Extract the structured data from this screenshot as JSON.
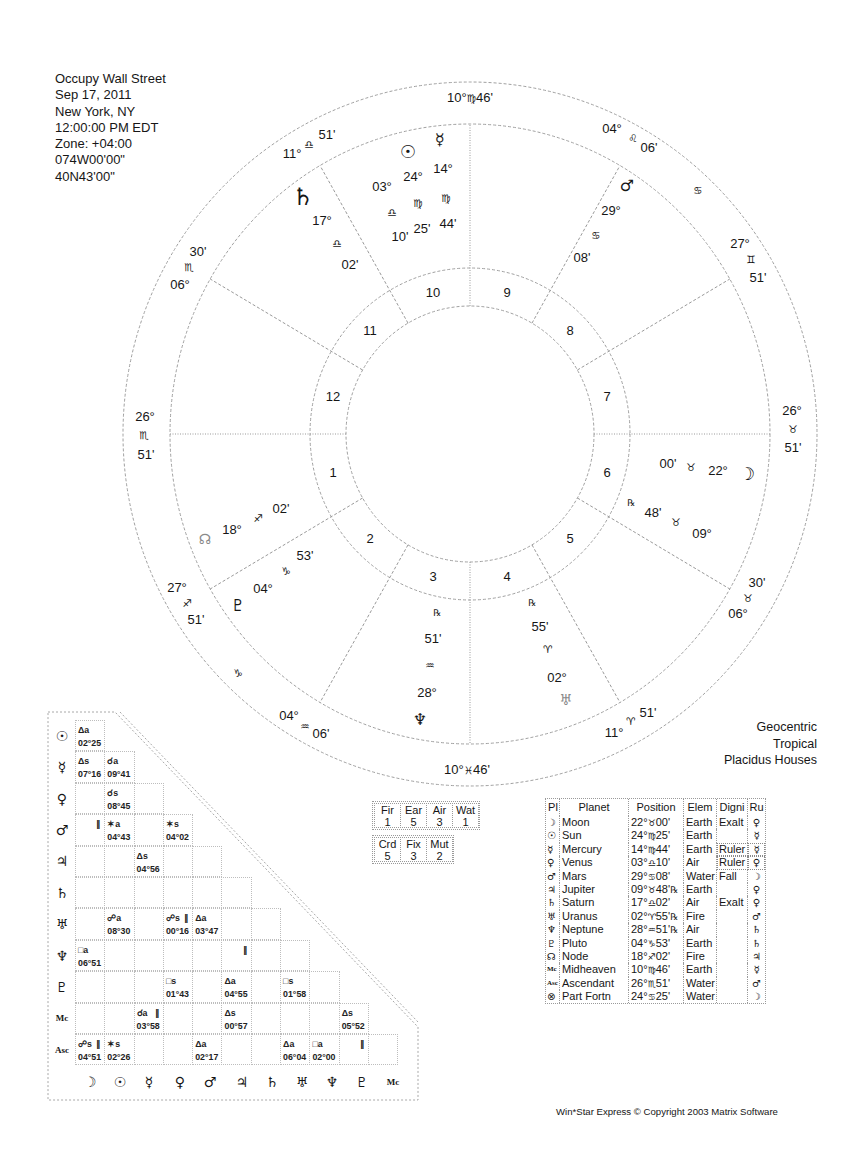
{
  "header": {
    "title": "Occupy Wall Street",
    "date": "Sep 17, 2011",
    "location": "New York, NY",
    "time": "12:00:00 PM EDT",
    "zone": "Zone: +04:00",
    "longitude": "074W00'00\"",
    "latitude": "40N43'00\""
  },
  "chart_type": {
    "line1": "Geocentric",
    "line2": "Tropical",
    "line3": "Placidus Houses"
  },
  "wheel": {
    "house_numbers": [
      "1",
      "2",
      "3",
      "4",
      "5",
      "6",
      "7",
      "8",
      "9",
      "10",
      "11",
      "12"
    ],
    "cusps": [
      {
        "deg": "26°",
        "sign": "♏",
        "min": "51'"
      },
      {
        "deg": "27°",
        "sign": "♐",
        "min": "51'"
      },
      {
        "deg": "04°",
        "sign": "♒",
        "min": "06'"
      },
      {
        "deg": "10°",
        "sign": "♓",
        "min": "46'"
      },
      {
        "deg": "11°",
        "sign": "♈",
        "min": "51'"
      },
      {
        "deg": "06°",
        "sign": "♉",
        "min": "30'"
      },
      {
        "deg": "26°",
        "sign": "♉",
        "min": "51'"
      },
      {
        "deg": "27°",
        "sign": "♊",
        "min": "51'"
      },
      {
        "deg": "04°",
        "sign": "♌",
        "min": "06'"
      },
      {
        "deg": "10°",
        "sign": "♍",
        "min": "46'"
      },
      {
        "deg": "11°",
        "sign": "♎",
        "min": "51'"
      },
      {
        "deg": "06°",
        "sign": "♏",
        "min": "30'"
      }
    ],
    "intercepted_signs": [
      "♋",
      "♑"
    ],
    "planets": {
      "sun": {
        "glyph": "☉",
        "deg": "24°",
        "sign": "♍",
        "min": "25'"
      },
      "mercury": {
        "glyph": "☿",
        "deg": "14°",
        "sign": "♍",
        "min": "44'"
      },
      "venus": {
        "deg": "03°",
        "sign": "♎",
        "min": "10'"
      },
      "saturn": {
        "glyph": "♄",
        "deg": "17°",
        "sign": "♎",
        "min": "02'"
      },
      "mars": {
        "glyph": "♂",
        "deg": "29°",
        "sign": "♋",
        "min": "08'"
      },
      "moon": {
        "glyph": "☽",
        "deg": "22°",
        "sign": "♉",
        "min": "00'"
      },
      "jupiter": {
        "retro": "℞",
        "deg": "09°",
        "sign": "♉",
        "min": "48'"
      },
      "uranus": {
        "glyph": "♅",
        "retro": "℞",
        "deg": "02°",
        "sign": "♈",
        "min": "55'"
      },
      "neptune": {
        "glyph": "♆",
        "retro": "℞",
        "deg": "28°",
        "sign": "♒",
        "min": "51'"
      },
      "pluto": {
        "glyph": "♇",
        "deg": "04°",
        "sign": "♑",
        "min": "53'"
      },
      "node": {
        "glyph": "☊",
        "deg": "18°",
        "sign": "♐",
        "min": "02'"
      }
    }
  },
  "aspect_grid": {
    "col_labels": [
      "☽",
      "☉",
      "☿",
      "♀",
      "♂",
      "♃",
      "♄",
      "♅",
      "♆",
      "♇",
      "Mc"
    ],
    "rows": [
      {
        "label": "☉",
        "cells": [
          {
            "asp": "Δa",
            "orb": "02°25"
          }
        ]
      },
      {
        "label": "☿",
        "cells": [
          {
            "asp": "Δs",
            "orb": "07°16"
          },
          {
            "asp": "☌a",
            "orb": "09°41"
          }
        ]
      },
      {
        "label": "♀",
        "cells": [
          {},
          {
            "asp": "☌s",
            "orb": "08°45"
          },
          {}
        ]
      },
      {
        "label": "♂",
        "cells": [
          {
            "par": "∥"
          },
          {
            "asp": "✶a",
            "orb": "04°43"
          },
          {},
          {
            "asp": "✶s",
            "orb": "04°02"
          }
        ]
      },
      {
        "label": "♃",
        "cells": [
          {},
          {},
          {
            "asp": "Δs",
            "orb": "04°56"
          },
          {},
          {}
        ]
      },
      {
        "label": "♄",
        "cells": [
          {},
          {},
          {},
          {},
          {},
          {}
        ]
      },
      {
        "label": "♅",
        "cells": [
          {},
          {
            "asp": "☍a",
            "orb": "08°30"
          },
          {},
          {
            "asp": "☍s",
            "par": "∥",
            "orb": "00°16"
          },
          {
            "asp": "Δa",
            "orb": "03°47"
          },
          {},
          {}
        ]
      },
      {
        "label": "♆",
        "cells": [
          {
            "asp": "□a",
            "orb": "06°51"
          },
          {},
          {},
          {},
          {},
          {
            "par": "∥"
          },
          {},
          {}
        ]
      },
      {
        "label": "♇",
        "cells": [
          {},
          {},
          {},
          {
            "asp": "□s",
            "orb": "01°43"
          },
          {},
          {
            "asp": "Δa",
            "orb": "04°55"
          },
          {},
          {
            "asp": "□s",
            "orb": "01°58"
          },
          {}
        ]
      },
      {
        "label": "Mc",
        "cells": [
          {},
          {},
          {
            "asp": "☌a",
            "par": "∥",
            "orb": "03°58"
          },
          {},
          {},
          {
            "asp": "Δs",
            "orb": "00°57"
          },
          {},
          {},
          {},
          {
            "asp": "Δs",
            "orb": "05°52"
          }
        ]
      },
      {
        "label": "Asc",
        "cells": [
          {
            "asp": "☍s",
            "par": "∥",
            "orb": "04°51"
          },
          {
            "asp": "✶s",
            "orb": "02°26"
          },
          {},
          {},
          {
            "asp": "Δa",
            "orb": "02°17"
          },
          {},
          {},
          {
            "asp": "Δa",
            "orb": "06°04"
          },
          {
            "asp": "□a",
            "orb": "02°00"
          },
          {
            "par": "∥"
          },
          {}
        ]
      }
    ]
  },
  "elements": [
    {
      "label": "Fir",
      "count": "1"
    },
    {
      "label": "Ear",
      "count": "5"
    },
    {
      "label": "Air",
      "count": "3"
    },
    {
      "label": "Wat",
      "count": "1"
    }
  ],
  "modes": [
    {
      "label": "Crd",
      "count": "5"
    },
    {
      "label": "Fix",
      "count": "3"
    },
    {
      "label": "Mut",
      "count": "2"
    }
  ],
  "planet_table": {
    "headers": [
      "Pl",
      "Planet",
      "Position",
      "Elem",
      "Digni",
      "Ru"
    ],
    "rows": [
      {
        "glyph": "☽",
        "planet": "Moon",
        "pos": {
          "deg": "22°",
          "sign": "♉",
          "min": "00'",
          "retro": ""
        },
        "elem": "Earth",
        "digni": "Exalt",
        "ru": "♀"
      },
      {
        "glyph": "☉",
        "planet": "Sun",
        "pos": {
          "deg": "24°",
          "sign": "♍",
          "min": "25'",
          "retro": ""
        },
        "elem": "Earth",
        "digni": "",
        "ru": "☿"
      },
      {
        "glyph": "☿",
        "planet": "Mercury",
        "pos": {
          "deg": "14°",
          "sign": "♍",
          "min": "44'",
          "retro": ""
        },
        "elem": "Earth",
        "digni": "Ruler",
        "ru": "☿"
      },
      {
        "glyph": "♀",
        "planet": "Venus",
        "pos": {
          "deg": "03°",
          "sign": "♎",
          "min": "10'",
          "retro": ""
        },
        "elem": "Air",
        "digni": "Ruler",
        "ru": "♀"
      },
      {
        "glyph": "♂",
        "planet": "Mars",
        "pos": {
          "deg": "29°",
          "sign": "♋",
          "min": "08'",
          "retro": ""
        },
        "elem": "Water",
        "digni": "Fall",
        "ru": "☽"
      },
      {
        "glyph": "♃",
        "planet": "Jupiter",
        "pos": {
          "deg": "09°",
          "sign": "♉",
          "min": "48'",
          "retro": "℞"
        },
        "elem": "Earth",
        "digni": "",
        "ru": "♀"
      },
      {
        "glyph": "♄",
        "planet": "Saturn",
        "pos": {
          "deg": "17°",
          "sign": "♎",
          "min": "02'",
          "retro": ""
        },
        "elem": "Air",
        "digni": "Exalt",
        "ru": "♀"
      },
      {
        "glyph": "♅",
        "planet": "Uranus",
        "pos": {
          "deg": "02°",
          "sign": "♈",
          "min": "55'",
          "retro": "℞"
        },
        "elem": "Fire",
        "digni": "",
        "ru": "♂"
      },
      {
        "glyph": "♆",
        "planet": "Neptune",
        "pos": {
          "deg": "28°",
          "sign": "♒",
          "min": "51'",
          "retro": "℞"
        },
        "elem": "Air",
        "digni": "",
        "ru": "♄"
      },
      {
        "glyph": "♇",
        "planet": "Pluto",
        "pos": {
          "deg": "04°",
          "sign": "♑",
          "min": "53'",
          "retro": ""
        },
        "elem": "Earth",
        "digni": "",
        "ru": "♄"
      },
      {
        "glyph": "☊",
        "planet": "Node",
        "pos": {
          "deg": "18°",
          "sign": "♐",
          "min": "02'",
          "retro": ""
        },
        "elem": "Fire",
        "digni": "",
        "ru": "♃"
      },
      {
        "glyph": "Mc",
        "planet": "Midheaven",
        "pos": {
          "deg": "10°",
          "sign": "♍",
          "min": "46'",
          "retro": ""
        },
        "elem": "Earth",
        "digni": "",
        "ru": "☿"
      },
      {
        "glyph": "Asc",
        "planet": "Ascendant",
        "pos": {
          "deg": "26°",
          "sign": "♏",
          "min": "51'",
          "retro": ""
        },
        "elem": "Water",
        "digni": "",
        "ru": "♂"
      },
      {
        "glyph": "⊗",
        "planet": "Part Fortn",
        "pos": {
          "deg": "24°",
          "sign": "♋",
          "min": "25'",
          "retro": ""
        },
        "elem": "Water",
        "digni": "",
        "ru": "☽"
      }
    ]
  },
  "footer": "Win*Star Express  © Copyright 2003 Matrix Software"
}
